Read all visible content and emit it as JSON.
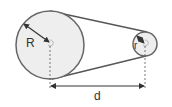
{
  "diagram": {
    "type": "belt-pulley",
    "colors": {
      "background": "#ffffff",
      "pulley_fill": "#eeeeee",
      "outline": "#666666",
      "belt": "#555555",
      "dimension": "#333333",
      "text": "#333333"
    },
    "large_pulley": {
      "label": "R",
      "cx": 50,
      "cy": 45,
      "r": 34
    },
    "small_pulley": {
      "label": "r",
      "cx": 145,
      "cy": 44,
      "r": 12
    },
    "distance": {
      "label": "d"
    }
  }
}
